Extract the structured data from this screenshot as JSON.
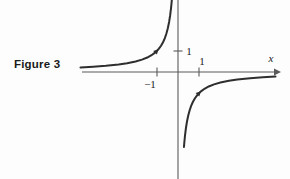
{
  "figure": {
    "caption": "Figure 3",
    "background_color": "#fdfdfd",
    "curve_color": "#2e2e2e",
    "axis_color": "#5a5a5a",
    "text_color": "#1a1a1a"
  },
  "chart_data": {
    "type": "line",
    "title": "Figure 3",
    "xlabel": "x",
    "ylabel": "",
    "grid": false,
    "legend": false,
    "xlim": [
      -4.6,
      4.7
    ],
    "ylim": [
      -4.6,
      3.4
    ],
    "x_ticks": [
      -1,
      1
    ],
    "x_tick_labels": [
      "−1",
      "1"
    ],
    "y_ticks": [
      1
    ],
    "y_tick_labels": [
      "1"
    ],
    "annotations": [
      {
        "text": "x",
        "role": "x-axis-label",
        "italic": true
      }
    ],
    "series": [
      {
        "name": "branch-upper-left",
        "comment": "y = -1/x for x < 0 : quadrant II branch rising to +infinity as x approaches 0 from the left",
        "x": [
          -4.6,
          -4.0,
          -3.4,
          -2.8,
          -2.4,
          -2.0,
          -1.7,
          -1.45,
          -1.25,
          -1.1,
          -1.0,
          -0.9,
          -0.8,
          -0.7,
          -0.62,
          -0.55,
          -0.48,
          -0.42,
          -0.37,
          -0.33,
          -0.3,
          -0.28
        ],
        "y": [
          0.217,
          0.25,
          0.294,
          0.357,
          0.417,
          0.5,
          0.588,
          0.69,
          0.8,
          0.909,
          1.0,
          1.111,
          1.25,
          1.429,
          1.613,
          1.818,
          2.083,
          2.381,
          2.703,
          3.03,
          3.333,
          3.571
        ],
        "arrow_at": {
          "x": -1.0,
          "y": 1.0,
          "direction": "up-right"
        }
      },
      {
        "name": "branch-lower-right",
        "comment": "y = -1/x for x > 0 : quadrant IV branch falling to -infinity as x approaches 0 from the right",
        "x": [
          0.28,
          0.3,
          0.33,
          0.37,
          0.42,
          0.48,
          0.55,
          0.62,
          0.7,
          0.8,
          0.9,
          1.0,
          1.1,
          1.25,
          1.45,
          1.7,
          2.0,
          2.4,
          2.8,
          3.4,
          4.0,
          4.6
        ],
        "y": [
          -3.571,
          -3.333,
          -3.03,
          -2.703,
          -2.381,
          -2.083,
          -1.818,
          -1.613,
          -1.429,
          -1.25,
          -1.111,
          -1.0,
          -0.909,
          -0.8,
          -0.69,
          -0.588,
          -0.5,
          -0.417,
          -0.357,
          -0.294,
          -0.25,
          -0.217
        ],
        "arrow_at": {
          "x": 1.0,
          "y": -1.0,
          "direction": "down-right"
        }
      }
    ]
  }
}
